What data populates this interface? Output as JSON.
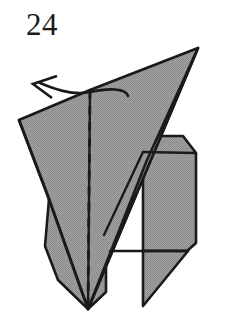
{
  "diagram": {
    "type": "origami-fold-step",
    "step_number": "24",
    "background_color": "#ffffff",
    "paper_fill_color": "#9b9b9b",
    "paper_fill_color_light": "#a8a8a8",
    "outline_color": "#1a1a1a",
    "crease_line_color": "#1a1a1a",
    "arrow_color": "#1a1a1a",
    "canvas": {
      "width": 228,
      "height": 326
    },
    "annotations": {
      "fold_arrow": {
        "name": "valley-fold-arrow",
        "direction": "up-left",
        "style": "curved-open-head",
        "tail_point": "128,94",
        "head_point": "33,84"
      },
      "crease": {
        "name": "vertical-dashed-crease",
        "style": "dashed",
        "from": "90,90",
        "to": "88,308",
        "dash_pattern": "9 7"
      }
    },
    "shapes": [
      {
        "name": "upper-left-flap",
        "fill": "#9b9b9b",
        "points": "19,120 89,90 198,48 88,308 50,200"
      },
      {
        "name": "right-panel",
        "fill": "#9b9b9b",
        "points": "143,151 160,135 183,135 196,152 196,242 188,251 143,251"
      },
      {
        "name": "lower-left-panel",
        "fill": "#9b9b9b",
        "points": "50,200 105,215 105,290 88,308 57,278 48,248"
      },
      {
        "name": "bottom-tab",
        "fill": "#9b9b9b",
        "points": "143,251 188,251 143,305"
      },
      {
        "name": "main-triangle",
        "fill": "#9b9b9b",
        "points": "198,48 88,308 130,160"
      }
    ],
    "edges": [
      {
        "name": "top-edge-left",
        "from": "19,120",
        "to": "198,48"
      },
      {
        "name": "apex-to-bottom-point",
        "from": "198,48",
        "to": "88,308"
      },
      {
        "name": "left-edge",
        "from": "19,120",
        "to": "50,200"
      },
      {
        "name": "diagonal-crease",
        "from": "89,90",
        "to": "88,308"
      },
      {
        "name": "panel-top-chamfer",
        "from": "160,135",
        "to": "143,151"
      },
      {
        "name": "panel-bottom-edge",
        "from": "143,251",
        "to": "188,251"
      }
    ]
  }
}
